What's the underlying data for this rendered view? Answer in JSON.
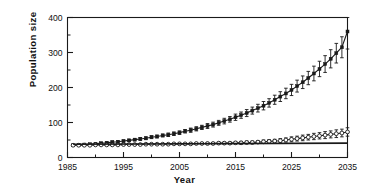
{
  "chart_data": {
    "type": "line",
    "title": "",
    "xlabel": "Year",
    "ylabel": "Population size",
    "xlim": [
      1985,
      2035
    ],
    "ylim": [
      0,
      400
    ],
    "xticks": [
      1985,
      1995,
      2005,
      2015,
      2025,
      2035
    ],
    "xtick_labels": [
      "1985",
      "1995",
      "2005",
      "2015",
      "2025",
      "2035"
    ],
    "xminor_ticks": [
      1990,
      2000,
      2010,
      2020,
      2030
    ],
    "yticks": [
      0,
      100,
      200,
      300,
      400
    ],
    "ytick_labels": [
      "0",
      "100",
      "200",
      "300",
      "400"
    ],
    "yminor_ticks": [
      50,
      150,
      250,
      350
    ],
    "grid": false,
    "legend": "none",
    "frame": "box",
    "series": [
      {
        "name": "Growing population (filled squares, error bars)",
        "marker": "filled-square",
        "color": "#1a1a1a",
        "x": [
          1986,
          1987,
          1988,
          1989,
          1990,
          1991,
          1992,
          1993,
          1994,
          1995,
          1996,
          1997,
          1998,
          1999,
          2000,
          2001,
          2002,
          2003,
          2004,
          2005,
          2006,
          2007,
          2008,
          2009,
          2010,
          2011,
          2012,
          2013,
          2014,
          2015,
          2016,
          2017,
          2018,
          2019,
          2020,
          2021,
          2022,
          2023,
          2024,
          2025,
          2026,
          2027,
          2028,
          2029,
          2030,
          2031,
          2032,
          2033,
          2034,
          2035
        ],
        "values": [
          35,
          36,
          37,
          38,
          39,
          41,
          42,
          44,
          45,
          47,
          49,
          51,
          53,
          55,
          58,
          60,
          63,
          65,
          68,
          71,
          75,
          78,
          82,
          86,
          90,
          94,
          99,
          104,
          109,
          115,
          121,
          127,
          134,
          141,
          148,
          156,
          165,
          174,
          183,
          193,
          204,
          215,
          227,
          240,
          253,
          267,
          282,
          298,
          315,
          360
        ],
        "yerr": [
          2,
          2,
          2,
          2,
          2,
          2,
          3,
          3,
          3,
          3,
          3,
          3,
          4,
          4,
          4,
          4,
          4,
          5,
          5,
          5,
          5,
          6,
          6,
          6,
          7,
          7,
          7,
          8,
          8,
          9,
          9,
          10,
          10,
          11,
          12,
          12,
          13,
          14,
          15,
          16,
          17,
          18,
          19,
          21,
          22,
          24,
          26,
          28,
          30,
          50
        ]
      },
      {
        "name": "Stable population (open circles, error bars)",
        "marker": "open-circle",
        "color": "#1a1a1a",
        "x": [
          1986,
          1987,
          1988,
          1989,
          1990,
          1991,
          1992,
          1993,
          1994,
          1995,
          1996,
          1997,
          1998,
          1999,
          2000,
          2001,
          2002,
          2003,
          2004,
          2005,
          2006,
          2007,
          2008,
          2009,
          2010,
          2011,
          2012,
          2013,
          2014,
          2015,
          2016,
          2017,
          2018,
          2019,
          2020,
          2021,
          2022,
          2023,
          2024,
          2025,
          2026,
          2027,
          2028,
          2029,
          2030,
          2031,
          2032,
          2033,
          2034,
          2035
        ],
        "values": [
          35,
          35,
          35,
          35,
          36,
          36,
          36,
          36,
          36,
          37,
          37,
          37,
          37,
          38,
          38,
          38,
          38,
          38,
          39,
          39,
          39,
          39,
          40,
          40,
          40,
          40,
          41,
          41,
          41,
          42,
          42,
          43,
          43,
          44,
          45,
          46,
          47,
          48,
          50,
          52,
          54,
          56,
          58,
          60,
          62,
          64,
          66,
          68,
          70,
          73
        ],
        "yerr": [
          1,
          1,
          1,
          1,
          1,
          1,
          1,
          1,
          1,
          1,
          1,
          1,
          1,
          1,
          1,
          2,
          2,
          2,
          2,
          2,
          2,
          2,
          2,
          2,
          3,
          3,
          3,
          3,
          3,
          3,
          4,
          4,
          4,
          4,
          5,
          5,
          5,
          6,
          6,
          7,
          7,
          8,
          8,
          9,
          9,
          10,
          10,
          11,
          11,
          12
        ]
      },
      {
        "name": "Reference line (constant)",
        "marker": "none",
        "color": "#1a1a1a",
        "x": [
          1986,
          2035
        ],
        "values": [
          38,
          41
        ],
        "yerr": null
      }
    ]
  },
  "axis_labels": {
    "y": "Population size",
    "x": "Year"
  }
}
